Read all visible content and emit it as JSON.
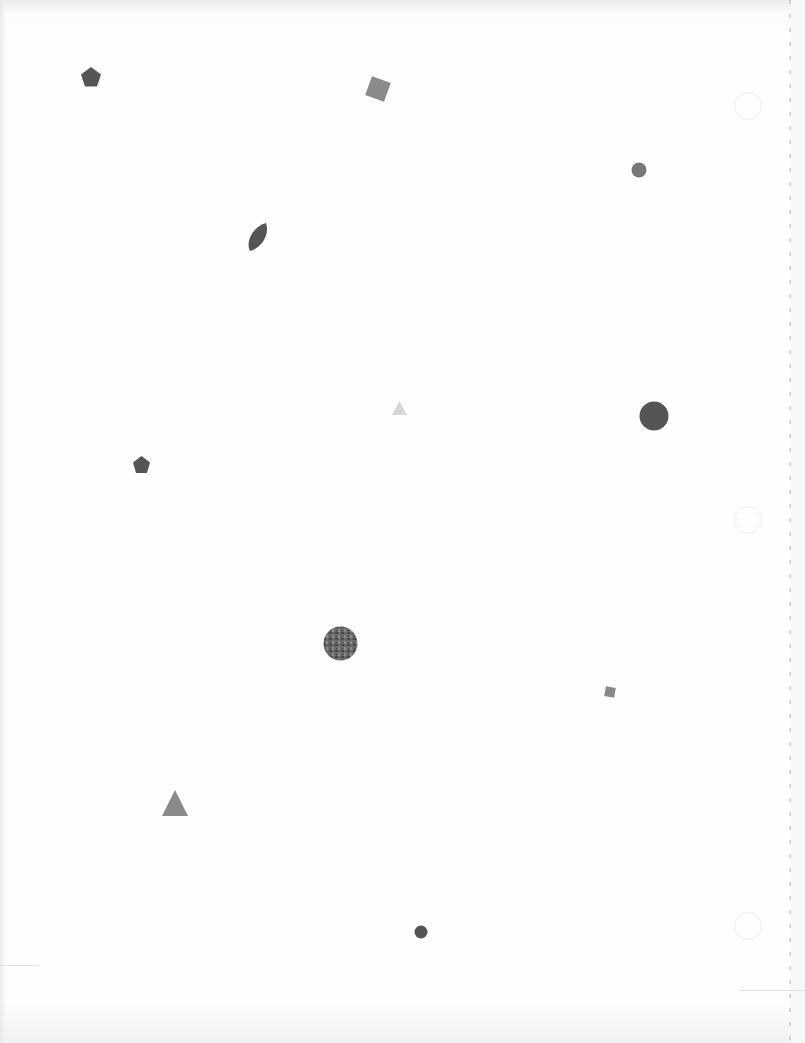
{
  "page": {
    "background": "#fdfdfd",
    "punch_holes": [
      {
        "x": 747,
        "y": 105,
        "r": 13
      },
      {
        "x": 747,
        "y": 519,
        "r": 13
      },
      {
        "x": 747,
        "y": 925,
        "r": 13
      }
    ],
    "shapes": [
      {
        "type": "pentagon",
        "x": 91,
        "y": 77,
        "size": 22,
        "color": "#555555"
      },
      {
        "type": "square",
        "x": 378,
        "y": 89,
        "size": 20,
        "rotation": 20,
        "color": "#8a8a8a"
      },
      {
        "type": "circle",
        "x": 639,
        "y": 170,
        "size": 16,
        "color": "#777777"
      },
      {
        "type": "leaf",
        "x": 258,
        "y": 237,
        "size": 26,
        "color": "#555555"
      },
      {
        "type": "triangle",
        "x": 399,
        "y": 409,
        "size": 14,
        "color": "#d8d8d8"
      },
      {
        "type": "circle",
        "x": 654,
        "y": 416,
        "size": 29,
        "color": "#555555"
      },
      {
        "type": "pentagon",
        "x": 141,
        "y": 465,
        "size": 18,
        "color": "#555555"
      },
      {
        "type": "textured-circle",
        "x": 340,
        "y": 643,
        "size": 34,
        "color": "#6a6a6a"
      },
      {
        "type": "square",
        "x": 610,
        "y": 692,
        "size": 10,
        "rotation": 10,
        "color": "#888888"
      },
      {
        "type": "triangle",
        "x": 175,
        "y": 804,
        "size": 28,
        "color": "#888888"
      },
      {
        "type": "circle",
        "x": 421,
        "y": 932,
        "size": 14,
        "color": "#555555"
      }
    ]
  }
}
